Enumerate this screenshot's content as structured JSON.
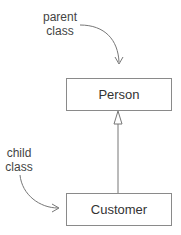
{
  "diagram": {
    "type": "uml-class-inheritance",
    "annotations": {
      "parent": [
        "parent",
        "class"
      ],
      "child": [
        "child",
        "class"
      ]
    },
    "classes": {
      "parent": "Person",
      "child": "Customer"
    },
    "relationship": "generalization",
    "colors": {
      "line": "#777777",
      "box_border": "#8a8a8a",
      "text": "#333333"
    }
  }
}
